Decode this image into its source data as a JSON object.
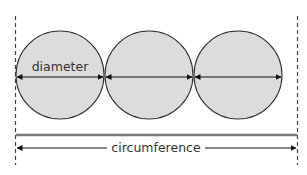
{
  "diagram": {
    "labels": {
      "diameter": "diameter",
      "circumference": "circumference"
    },
    "circles": [
      {
        "cx": 60,
        "cy": 75,
        "r": 44
      },
      {
        "cx": 149,
        "cy": 75,
        "r": 44
      },
      {
        "cx": 238,
        "cy": 75,
        "r": 44
      }
    ],
    "colors": {
      "circle_fill": "#dcdcdc",
      "circle_stroke": "#333333",
      "arrow": "#111111",
      "baseline": "#7a7a7a",
      "dashed": "#444444"
    }
  }
}
